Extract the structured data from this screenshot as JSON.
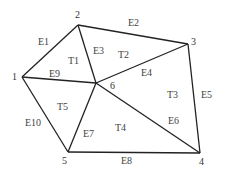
{
  "diagram": {
    "type": "triangular-mesh",
    "nodes": [
      {
        "id": "1",
        "label": "1",
        "x": 22,
        "y": 77,
        "lx": 12,
        "ly": 80
      },
      {
        "id": "2",
        "label": "2",
        "x": 78,
        "y": 25,
        "lx": 75,
        "ly": 18
      },
      {
        "id": "3",
        "label": "3",
        "x": 188,
        "y": 44,
        "lx": 191,
        "ly": 45
      },
      {
        "id": "4",
        "label": "4",
        "x": 200,
        "y": 153,
        "lx": 199,
        "ly": 165
      },
      {
        "id": "5",
        "label": "5",
        "x": 68,
        "y": 152,
        "lx": 62,
        "ly": 164
      },
      {
        "id": "6",
        "label": "6",
        "x": 96,
        "y": 83,
        "lx": 110,
        "ly": 89
      }
    ],
    "edges": [
      {
        "id": "E1",
        "label": "E1",
        "from": "1",
        "to": "2",
        "lx": 38,
        "ly": 45
      },
      {
        "id": "E2",
        "label": "E2",
        "from": "2",
        "to": "3",
        "lx": 128,
        "ly": 26
      },
      {
        "id": "E3",
        "label": "E3",
        "from": "2",
        "to": "6",
        "lx": 93,
        "ly": 54
      },
      {
        "id": "E4",
        "label": "E4",
        "from": "6",
        "to": "3",
        "lx": 141,
        "ly": 76
      },
      {
        "id": "E5",
        "label": "E5",
        "from": "3",
        "to": "4",
        "lx": 201,
        "ly": 98
      },
      {
        "id": "E6",
        "label": "E6",
        "from": "6",
        "to": "4",
        "lx": 168,
        "ly": 124
      },
      {
        "id": "E7",
        "label": "E7",
        "from": "6",
        "to": "5",
        "lx": 83,
        "ly": 137
      },
      {
        "id": "E8",
        "label": "E8",
        "from": "5",
        "to": "4",
        "lx": 121,
        "ly": 164
      },
      {
        "id": "E9",
        "label": "E9",
        "from": "1",
        "to": "6",
        "lx": 49,
        "ly": 77
      },
      {
        "id": "E10",
        "label": "E10",
        "from": "1",
        "to": "5",
        "lx": 25,
        "ly": 126
      }
    ],
    "triangles": [
      {
        "id": "T1",
        "label": "T1",
        "lx": 68,
        "ly": 64
      },
      {
        "id": "T2",
        "label": "T2",
        "lx": 118,
        "ly": 58
      },
      {
        "id": "T3",
        "label": "T3",
        "lx": 167,
        "ly": 98
      },
      {
        "id": "T4",
        "label": "T4",
        "lx": 115,
        "ly": 131
      },
      {
        "id": "T5",
        "label": "T5",
        "lx": 57,
        "ly": 110
      }
    ]
  }
}
